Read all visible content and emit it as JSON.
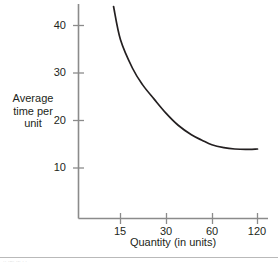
{
  "chart_data": {
    "type": "line",
    "title": "",
    "xlabel": "Quantity (in units)",
    "ylabel": "Average time per unit",
    "ylabel_lines": [
      "Average",
      "time per",
      "unit"
    ],
    "x_tick_labels": [
      "15",
      "30",
      "60",
      "120"
    ],
    "y_tick_labels": [
      "10",
      "20",
      "30",
      "40"
    ],
    "x_scale": "log2",
    "xlim": [
      12,
      130
    ],
    "ylim": [
      0,
      45
    ],
    "grid": false,
    "legend": null,
    "series": [
      {
        "name": "Average time per unit",
        "color": "#231f20",
        "x": [
          13.5,
          15,
          18,
          21,
          25,
          30,
          36,
          44,
          52,
          60,
          72,
          85,
          100,
          120
        ],
        "values": [
          44,
          37,
          31,
          27.5,
          24.5,
          21.5,
          19,
          17,
          15.8,
          14.9,
          14.3,
          14.0,
          13.9,
          14.0
        ]
      }
    ]
  },
  "axes": {
    "x_ticks": [
      {
        "label": "15"
      },
      {
        "label": "30"
      },
      {
        "label": "60"
      },
      {
        "label": "120"
      }
    ],
    "y_ticks": [
      {
        "label": "40"
      },
      {
        "label": "30"
      },
      {
        "label": "20"
      },
      {
        "label": "10"
      }
    ],
    "axis_color": "#8b8b8b",
    "curve_color": "#231f20"
  },
  "labels": {
    "y_title_line1": "Average",
    "y_title_line2": "time per",
    "y_title_line3": "unit",
    "x_title": "Quantity (in units)"
  },
  "footer": {
    "smudge_text": "·· ·--· ·-· ·  ·"
  }
}
